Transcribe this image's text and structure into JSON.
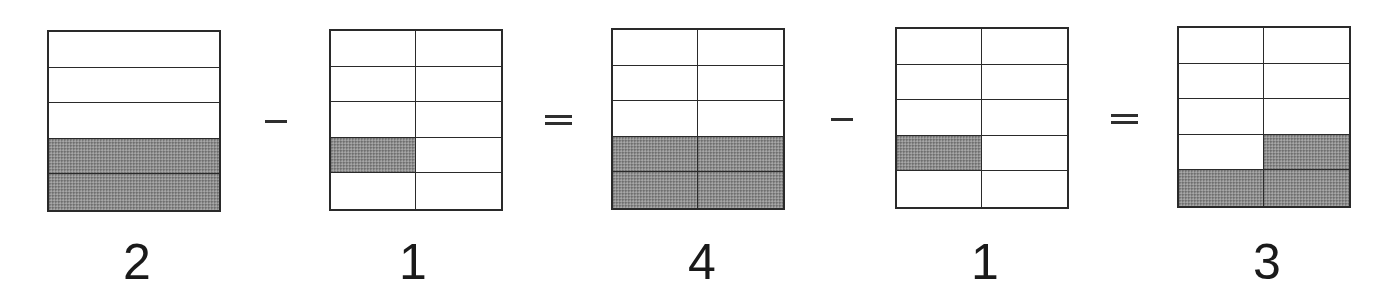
{
  "diagram": {
    "boxes": [
      {
        "id": "box-1",
        "left": 47,
        "top": 30,
        "rows": 5,
        "cols": 1,
        "shaded": [
          [
            3,
            0
          ],
          [
            4,
            0
          ]
        ],
        "label": "2",
        "label_center_x": 137
      },
      {
        "id": "box-2",
        "left": 329,
        "top": 29,
        "rows": 5,
        "cols": 2,
        "shaded": [
          [
            3,
            0
          ]
        ],
        "label": "1",
        "label_center_x": 413
      },
      {
        "id": "box-3",
        "left": 611,
        "top": 28,
        "rows": 5,
        "cols": 2,
        "shaded": [
          [
            3,
            0
          ],
          [
            3,
            1
          ],
          [
            4,
            0
          ],
          [
            4,
            1
          ]
        ],
        "label": "4",
        "label_center_x": 702
      },
      {
        "id": "box-4",
        "left": 895,
        "top": 27,
        "rows": 5,
        "cols": 2,
        "shaded": [
          [
            3,
            0
          ]
        ],
        "label": "1",
        "label_center_x": 985
      },
      {
        "id": "box-5",
        "left": 1177,
        "top": 26,
        "rows": 5,
        "cols": 2,
        "shaded": [
          [
            3,
            1
          ],
          [
            4,
            0
          ],
          [
            4,
            1
          ]
        ],
        "label": "3",
        "label_center_x": 1267
      }
    ],
    "operators": [
      {
        "type": "minus",
        "symbol": "−",
        "left": 265,
        "top": 120,
        "width": 22
      },
      {
        "type": "equals",
        "symbol": "=",
        "left": 545,
        "top": 115,
        "width": 27
      },
      {
        "type": "minus",
        "symbol": "−",
        "left": 831,
        "top": 118,
        "width": 22
      },
      {
        "type": "equals",
        "symbol": "=",
        "left": 1111,
        "top": 114,
        "width": 27
      }
    ],
    "colors": {
      "line": "#2a2a2a",
      "shade": "#8d8d8d",
      "background": "#ffffff",
      "text": "#1a1a1a"
    }
  }
}
